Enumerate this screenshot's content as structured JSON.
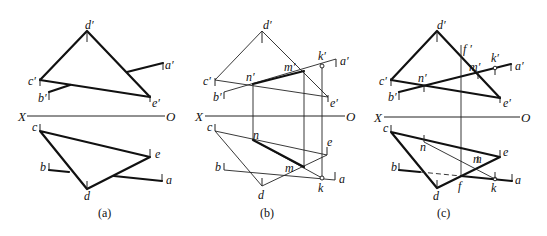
{
  "figure": {
    "panels": [
      {
        "caption": "(a)",
        "axis": {
          "left": "X",
          "right": "O"
        },
        "labels": {
          "d1": "d′",
          "c1": "c′",
          "e1": "e′",
          "a1": "a′",
          "b1": "b′",
          "c": "c",
          "e": "e",
          "d": "d",
          "b": "b",
          "a": "a"
        }
      },
      {
        "caption": "(b)",
        "axis": {
          "left": "X",
          "right": "O"
        },
        "labels": {
          "d1": "d′",
          "c1": "c′",
          "e1": "e′",
          "a1": "a′",
          "b1": "b′",
          "n1": "n′",
          "m1": "m′",
          "k1": "k′",
          "c": "c",
          "e": "e",
          "d": "d",
          "b": "b",
          "a": "a",
          "n": "n",
          "m": "m",
          "k": "k"
        }
      },
      {
        "caption": "(c)",
        "axis": {
          "left": "X",
          "right": "O"
        },
        "labels": {
          "d1": "d′",
          "c1": "c′",
          "e1": "e′",
          "a1": "a′",
          "b1": "b′",
          "n1": "n′",
          "m1": "m′",
          "k1": "k′",
          "f1": "f ′",
          "c": "c",
          "e": "e",
          "d": "d",
          "b": "b",
          "a": "a",
          "n": "n",
          "m": "m",
          "k": "k",
          "f": "f"
        }
      }
    ]
  }
}
